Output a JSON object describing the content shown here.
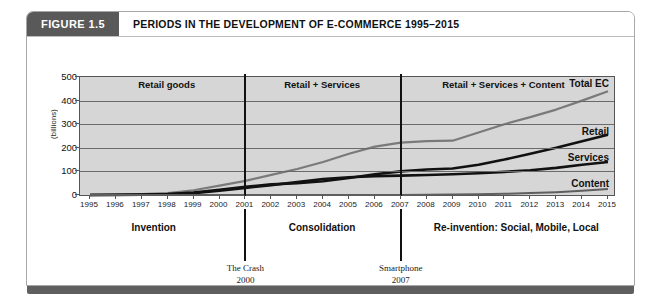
{
  "figure": {
    "tag": "FIGURE 1.5",
    "title": "PERIODS IN THE DEVELOPMENT OF E-COMMERCE 1995–2015"
  },
  "chart_data": {
    "type": "line",
    "title": "PERIODS IN THE DEVELOPMENT OF E-COMMERCE 1995–2015",
    "xlabel": "",
    "ylabel": "(billions)",
    "ylim": [
      0,
      500
    ],
    "yticks": [
      0,
      100,
      200,
      300,
      400,
      500
    ],
    "grid": true,
    "legend": "inline-right",
    "x": [
      1995,
      1996,
      1997,
      1998,
      1999,
      2000,
      2001,
      2002,
      2003,
      2004,
      2005,
      2006,
      2007,
      2008,
      2009,
      2010,
      2011,
      2012,
      2013,
      2014,
      2015
    ],
    "categories": [
      "1995",
      "1996",
      "1997",
      "1998",
      "1999",
      "2000",
      "2001",
      "2002",
      "2003",
      "2004",
      "2005",
      "2006",
      "2007",
      "2008",
      "2009",
      "2010",
      "2011",
      "2012",
      "2013",
      "2014",
      "2015"
    ],
    "series": [
      {
        "name": "Total EC",
        "color": "#7a7a7a",
        "values": [
          1,
          2,
          4,
          8,
          20,
          40,
          60,
          85,
          110,
          140,
          175,
          205,
          222,
          228,
          230,
          265,
          300,
          330,
          362,
          400,
          440
        ]
      },
      {
        "name": "Retail",
        "color": "#111111",
        "values": [
          0,
          1,
          2,
          4,
          10,
          22,
          35,
          45,
          50,
          58,
          72,
          88,
          100,
          108,
          112,
          128,
          150,
          175,
          200,
          228,
          255
        ]
      },
      {
        "name": "Services",
        "color": "#111111",
        "values": [
          0,
          0,
          1,
          3,
          8,
          18,
          30,
          42,
          55,
          68,
          75,
          80,
          82,
          85,
          88,
          92,
          98,
          105,
          115,
          128,
          140
        ]
      },
      {
        "name": "Content",
        "color": "#5e5e5e",
        "values": [
          0,
          0,
          0,
          0,
          0,
          0,
          0,
          0,
          0,
          0,
          0,
          0,
          0,
          1,
          2,
          3,
          5,
          8,
          12,
          18,
          25
        ]
      }
    ],
    "bands": [
      {
        "label": "Retail goods",
        "start": 1995,
        "end": 2001
      },
      {
        "label": "Retail + Services",
        "start": 2001,
        "end": 2007
      },
      {
        "label": "Retail + Services + Content",
        "start": 2007,
        "end": 2015
      }
    ],
    "band_dividers": [
      2001,
      2007
    ],
    "eras": [
      {
        "label": "Invention",
        "center": 1997.5
      },
      {
        "label": "Consolidation",
        "center": 2004
      },
      {
        "label": "Re-invention: Social, Mobile, Local",
        "center": 2011.5
      }
    ],
    "event_markers": [
      {
        "name": "The Crash",
        "year_label": "2000",
        "at": 2001
      },
      {
        "name": "Smartphone",
        "year_label": "2007",
        "at": 2007
      }
    ]
  }
}
